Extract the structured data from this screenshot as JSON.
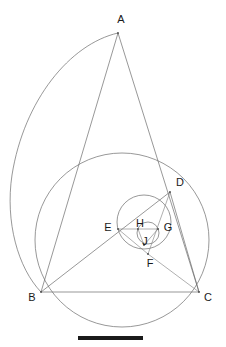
{
  "figure": {
    "width": 226,
    "height": 347,
    "background_color": "#ffffff",
    "stroke_color": "#6b6b6b",
    "label_color": "#1a1a1a",
    "scalebar_color": "#1a1a1a"
  },
  "points": {
    "A": {
      "label": "A",
      "x": 118,
      "y": 33,
      "label_x": 121,
      "label_y": 20
    },
    "B": {
      "label": "B",
      "x": 41,
      "y": 292,
      "label_x": 32,
      "label_y": 298
    },
    "C": {
      "label": "C",
      "x": 199,
      "y": 292,
      "label_x": 208,
      "label_y": 298
    },
    "D": {
      "label": "D",
      "x": 170,
      "y": 192,
      "label_x": 180,
      "label_y": 183
    },
    "E": {
      "label": "E",
      "x": 118,
      "y": 229,
      "label_x": 108,
      "label_y": 228
    },
    "F": {
      "label": "F",
      "x": 148,
      "y": 254,
      "label_x": 150,
      "label_y": 264
    },
    "G": {
      "label": "G",
      "x": 158,
      "y": 229,
      "label_x": 168,
      "label_y": 228
    },
    "H": {
      "label": "H",
      "x": 138,
      "y": 229,
      "label_x": 140,
      "label_y": 225
    },
    "J": {
      "label": "J",
      "x": 144,
      "y": 243,
      "label_x": 145,
      "label_y": 242
    }
  },
  "circles": {
    "outer_arc": {
      "name": "large-arc-through-A-and-B",
      "cx": 96,
      "cy": 190,
      "r": 160,
      "description": "Large arc sweeping from A leftward down to B"
    },
    "circumcircle": {
      "name": "circumcircle-B-D-C",
      "cx": 122,
      "cy": 240,
      "r": 88,
      "description": "Circle through B, D and C"
    },
    "medium_circle": {
      "name": "circle-through-E-D-F",
      "cx": 144,
      "cy": 222,
      "r": 27,
      "description": "Circle passing through E, D and F"
    },
    "small_circle": {
      "name": "small-circle-through-H-G-J",
      "cx": 148,
      "cy": 233,
      "r": 11,
      "description": "Small inner circle near H, G, J"
    }
  },
  "segments": [
    {
      "name": "segment-AB",
      "from": "A",
      "to": "B"
    },
    {
      "name": "segment-AC",
      "from": "A",
      "to": "C"
    },
    {
      "name": "segment-BC",
      "from": "B",
      "to": "C"
    },
    {
      "name": "segment-BD",
      "from": "B",
      "to": "D"
    },
    {
      "name": "segment-DC",
      "from": "D",
      "to": "C"
    },
    {
      "name": "segment-EG",
      "from": "E",
      "to": "G"
    },
    {
      "name": "segment-EF",
      "from": "E",
      "to": "F"
    },
    {
      "name": "segment-DF",
      "from": "D",
      "to": "F"
    },
    {
      "name": "segment-FC",
      "from": "F",
      "to": "C"
    },
    {
      "name": "segment-HJ",
      "from": "H",
      "to": "J"
    },
    {
      "name": "segment-GJ",
      "from": "G",
      "to": "J"
    }
  ],
  "scalebar": {
    "name": "scale-bar",
    "x1": 78,
    "x2": 143,
    "y": 338,
    "thickness": 4,
    "label": ""
  }
}
